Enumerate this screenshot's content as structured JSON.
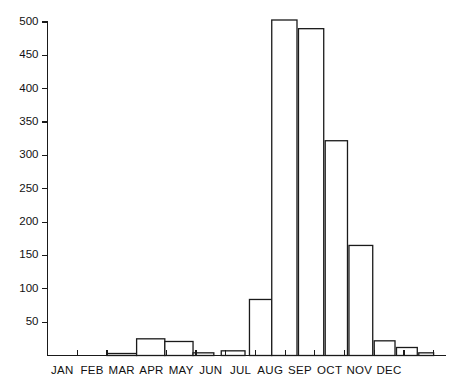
{
  "chart_data": {
    "type": "bar",
    "title": "",
    "subtitle": "",
    "xlabel": "",
    "ylabel": "",
    "categories": [
      "JAN",
      "FEB",
      "MAR",
      "APR",
      "MAY",
      "JUN",
      "JUL",
      "AUG",
      "SEP",
      "OCT",
      "NOV",
      "DEC"
    ],
    "values": [
      0,
      0,
      3,
      25,
      21,
      4,
      84,
      503,
      490,
      322,
      165,
      22
    ],
    "bars": [
      {
        "label": "JAN",
        "value": 0,
        "start": 0,
        "end": 1
      },
      {
        "label": "FEB",
        "value": 0,
        "start": 1,
        "end": 2
      },
      {
        "label": "MAR",
        "value": 3,
        "start": 2,
        "end": 3
      },
      {
        "label": "APR",
        "value": 25,
        "start": 3,
        "end": 3.95
      },
      {
        "label": "MAY",
        "value": 21,
        "start": 3.95,
        "end": 4.9
      },
      {
        "label": "MAY-late",
        "value": 4,
        "start": 4.9,
        "end": 5.6
      },
      {
        "label": "JUN",
        "value": 7,
        "start": 5.85,
        "end": 6.65
      },
      {
        "label": "JUL-early",
        "value": 84,
        "start": 6.8,
        "end": 7.55
      },
      {
        "label": "JUL",
        "value": 503,
        "start": 7.55,
        "end": 8.4
      },
      {
        "label": "AUG",
        "value": 490,
        "start": 8.45,
        "end": 9.3
      },
      {
        "label": "SEP-early",
        "value": 322,
        "start": 9.35,
        "end": 10.1
      },
      {
        "label": "SEP",
        "value": 165,
        "start": 10.15,
        "end": 10.95
      },
      {
        "label": "OCT",
        "value": 22,
        "start": 11.0,
        "end": 11.7
      },
      {
        "label": "OCT-late",
        "value": 12,
        "start": 11.75,
        "end": 12.45
      },
      {
        "label": "NOV",
        "value": 4,
        "start": 12.5,
        "end": 13.0
      }
    ],
    "y_ticks": [
      50,
      100,
      150,
      200,
      250,
      300,
      350,
      400,
      450,
      500
    ],
    "ylim": [
      0,
      515
    ],
    "xlim": [
      0,
      13.4
    ],
    "grid": false,
    "legend": null,
    "legend_position": "none",
    "colors": {
      "bar_fill": "#ffffff",
      "bar_stroke": "#1a1a1a",
      "axis": "#1a1a1a",
      "text": "#111111",
      "background": "#ffffff"
    }
  }
}
